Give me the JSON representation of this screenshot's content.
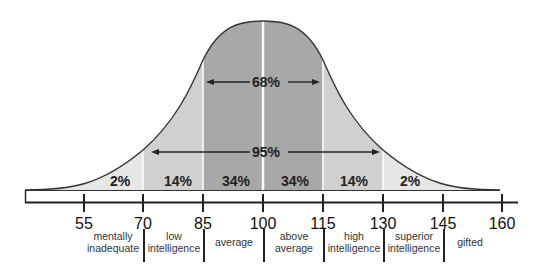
{
  "diagram": {
    "title": "",
    "type": "normal-distribution-iq",
    "colors": {
      "background": "#ffffff",
      "outer_band": "#e6e6e6",
      "middle_band": "#d0d0d0",
      "center_band": "#a8a8a8",
      "curve": "#333333",
      "divider": "#ffffff",
      "text": "#222222"
    },
    "ranges": {
      "inner": {
        "label": "68%",
        "from": 85,
        "to": 115
      },
      "outer": {
        "label": "95%",
        "from": 70,
        "to": 130
      }
    },
    "bands": [
      {
        "from": 55,
        "to": 70,
        "label": "2%"
      },
      {
        "from": 70,
        "to": 85,
        "label": "14%"
      },
      {
        "from": 85,
        "to": 100,
        "label": "34%"
      },
      {
        "from": 100,
        "to": 115,
        "label": "34%"
      },
      {
        "from": 115,
        "to": 130,
        "label": "14%"
      },
      {
        "from": 130,
        "to": 145,
        "label": "2%"
      }
    ],
    "axis": {
      "ticks": [
        "55",
        "70",
        "85",
        "100",
        "115",
        "130",
        "145",
        "160"
      ]
    },
    "categories": [
      {
        "label_line1": "mentally",
        "label_line2": "inadequate"
      },
      {
        "label_line1": "low",
        "label_line2": "intelligence"
      },
      {
        "label_line1": "average",
        "label_line2": ""
      },
      {
        "label_line1": "above",
        "label_line2": "average"
      },
      {
        "label_line1": "high",
        "label_line2": "intelligence"
      },
      {
        "label_line1": "superior",
        "label_line2": "intelligence"
      },
      {
        "label_line1": "gifted",
        "label_line2": ""
      }
    ]
  }
}
